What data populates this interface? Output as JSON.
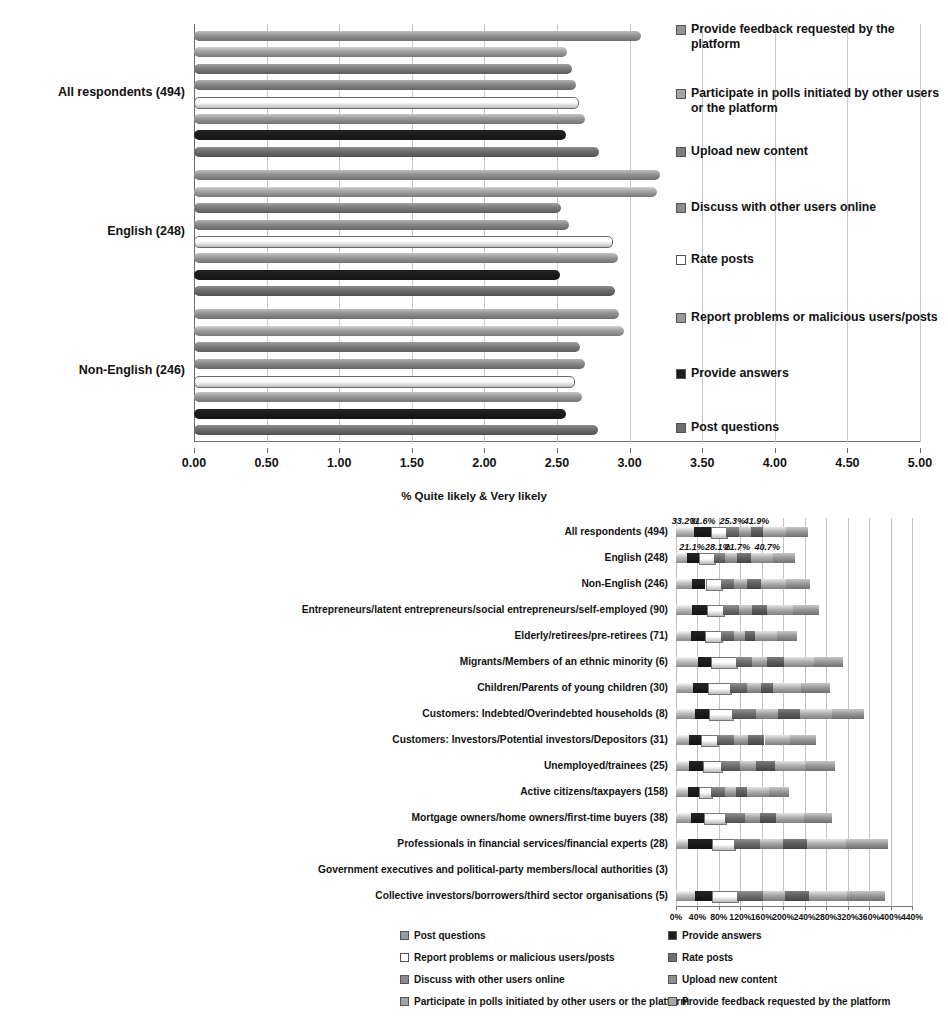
{
  "colors": {
    "post_questions": "#6e6e6e",
    "provide_answers": "#1c1c1c",
    "report_problems": "#ffffff",
    "rate_posts": "#9a9a9a",
    "discuss_online": "#8a8a8a",
    "upload_content": "#7d7d7d",
    "participate_polls": "#a3a3a3",
    "provide_feedback": "#949494",
    "gridline": "#c9c9c9",
    "axis": "#6a6a6a"
  },
  "series_labels": {
    "post_questions": "Post questions",
    "provide_answers": "Provide answers",
    "report_problems": "Report problems or malicious users/posts",
    "rate_posts": "Rate posts",
    "discuss_online": "Discuss with other users online",
    "upload_content": "Upload new content",
    "participate_polls": "Participate in polls initiated by other users or the platform",
    "provide_feedback": "Provide feedback requested by the platform"
  },
  "top_chart": {
    "legend": [
      {
        "label": "Provide feedback requested by the platform",
        "key": "provide_feedback",
        "color": "#949494"
      },
      {
        "label": "Participate in polls initiated by other users or the platform",
        "key": "participate_polls",
        "color": "#a3a3a3"
      },
      {
        "label": "Upload new content",
        "key": "upload_content",
        "color": "#7d7d7d"
      },
      {
        "label": "Discuss with other users online",
        "key": "discuss_online",
        "color": "#8a8a8a"
      },
      {
        "label": "Rate posts",
        "key": "rate_posts",
        "color": "#ffffff"
      },
      {
        "label": "Report problems or malicious users/posts",
        "key": "report_problems",
        "color": "#9a9a9a"
      },
      {
        "label": "Provide answers",
        "key": "provide_answers",
        "color": "#1c1c1c"
      },
      {
        "label": "Post questions",
        "key": "post_questions",
        "color": "#6e6e6e"
      }
    ]
  },
  "bottom_chart": {
    "title": "% Quite likely & Very likely",
    "legend_left": [
      {
        "label": "Post questions",
        "color": "#9a9a9a"
      },
      {
        "label": "Report problems or malicious users/posts",
        "color": "#ffffff"
      },
      {
        "label": "Discuss with other users online",
        "color": "#8a8a8a"
      },
      {
        "label": "Participate in polls initiated by other users or the platform",
        "color": "#a3a3a3"
      }
    ],
    "legend_right": [
      {
        "label": "Provide answers",
        "color": "#1c1c1c"
      },
      {
        "label": "Rate posts",
        "color": "#6e6e6e"
      },
      {
        "label": "Upload new content",
        "color": "#8f8f8f"
      },
      {
        "label": "Provide feedback requested by the platform",
        "color": "#a8a8a8"
      }
    ]
  },
  "chart_data": [
    {
      "type": "bar",
      "orientation": "horizontal",
      "title": "",
      "xlabel": "",
      "ylabel": "",
      "xlim": [
        0,
        5
      ],
      "xticks": [
        "0.00",
        "0.50",
        "1.00",
        "1.50",
        "2.00",
        "2.50",
        "3.00",
        "3.50",
        "4.00",
        "4.50",
        "5.00"
      ],
      "grid": true,
      "legend_position": "right",
      "categories": [
        "All respondents (494)",
        "English (248)",
        "Non-English (246)"
      ],
      "series": [
        {
          "name": "Provide feedback requested by the platform",
          "color": "#949494",
          "values": [
            3.08,
            3.21,
            2.93
          ]
        },
        {
          "name": "Participate in polls initiated by other users or the platform",
          "color": "#a3a3a3",
          "values": [
            2.57,
            3.19,
            2.96
          ]
        },
        {
          "name": "Upload new content",
          "color": "#7d7d7d",
          "values": [
            2.6,
            2.53,
            2.66
          ]
        },
        {
          "name": "Discuss with other users online",
          "color": "#8a8a8a",
          "values": [
            2.63,
            2.58,
            2.69
          ]
        },
        {
          "name": "Rate posts",
          "color": "#ffffff",
          "values": [
            2.64,
            2.87,
            2.61
          ]
        },
        {
          "name": "Report problems or malicious users/posts",
          "color": "#9a9a9a",
          "values": [
            2.69,
            2.92,
            2.67
          ]
        },
        {
          "name": "Provide answers",
          "color": "#1c1c1c",
          "values": [
            2.56,
            2.52,
            2.56
          ]
        },
        {
          "name": "Post questions",
          "color": "#6e6e6e",
          "values": [
            2.79,
            2.9,
            2.78
          ]
        }
      ]
    },
    {
      "type": "bar",
      "subtype": "stacked",
      "orientation": "horizontal",
      "title": "% Quite likely & Very likely",
      "xlabel": "",
      "ylabel": "",
      "xlim": [
        0,
        440
      ],
      "xunit": "%",
      "xticks": [
        "0%",
        "40%",
        "80%",
        "120%",
        "160%",
        "200%",
        "240%",
        "280%",
        "320%",
        "360%",
        "400%",
        "440%"
      ],
      "grid": true,
      "legend_position": "bottom",
      "categories": [
        "All respondents (494)",
        "English (248)",
        "Non-English (246)",
        "Entrepreneurs/latent entrepreneurs/social entrepreneurs/self-employed (90)",
        "Elderly/retirees/pre-retirees (71)",
        "Migrants/Members of an ethnic minority (6)",
        "Children/Parents of young children (30)",
        "Customers: Indebted/Overindebted households (8)",
        "Customers: Investors/Potential investors/Depositors (31)",
        "Unemployed/trainees (25)",
        "Active citizens/taxpayers (158)",
        "Mortgage owners/home owners/first-time buyers (38)",
        "Professionals in financial services/financial experts (28)",
        "Government executives and political-party members/local authorities (3)",
        "Collective investors/borrowers/third sector organisations (5)"
      ],
      "series": [
        {
          "name": "Post questions",
          "color": "#bdbdbd",
          "values": [
            33.2,
            21.1,
            29.0,
            30.0,
            28.0,
            41.0,
            32.0,
            36.0,
            24.0,
            25.0,
            23.0,
            28.0,
            22.0,
            0.0,
            35.0
          ]
        },
        {
          "name": "Provide answers",
          "color": "#1c1c1c",
          "values": [
            31.6,
            21.1,
            26.0,
            28.0,
            26.0,
            25.0,
            27.0,
            25.0,
            22.0,
            26.0,
            20.0,
            24.0,
            45.0,
            0.0,
            33.0
          ]
        },
        {
          "name": "Report problems or malicious users/posts",
          "color": "#ffffff",
          "values": [
            28.0,
            28.1,
            28.0,
            30.0,
            30.0,
            45.0,
            42.0,
            44.0,
            30.0,
            32.0,
            22.0,
            40.0,
            42.0,
            0.0,
            46.0
          ]
        },
        {
          "name": "Rate posts",
          "color": "#6f6f6f",
          "values": [
            25.3,
            21.7,
            26.0,
            30.0,
            24.0,
            30.0,
            32.0,
            44.0,
            33.0,
            36.0,
            26.0,
            36.0,
            48.0,
            0.0,
            48.0
          ]
        },
        {
          "name": "Discuss with other users online",
          "color": "#a5a5a5",
          "values": [
            22.0,
            22.0,
            24.0,
            24.0,
            20.0,
            28.0,
            26.0,
            42.0,
            26.0,
            30.0,
            20.0,
            28.0,
            42.0,
            0.0,
            42.0
          ]
        },
        {
          "name": "Upload new content",
          "color": "#5f5f5f",
          "values": [
            23.0,
            26.0,
            26.0,
            28.0,
            20.0,
            32.0,
            22.0,
            40.0,
            30.0,
            36.0,
            22.0,
            30.0,
            46.0,
            0.0,
            44.0
          ]
        },
        {
          "name": "Participate in polls initiated by other users or the platform",
          "color": "#b0b0b0",
          "values": [
            41.9,
            40.7,
            46.0,
            48.0,
            40.0,
            56.0,
            52.0,
            60.0,
            48.0,
            56.0,
            40.0,
            52.0,
            72.0,
            0.0,
            70.0
          ]
        },
        {
          "name": "Provide feedback requested by the platform",
          "color": "#9a9a9a",
          "values": [
            42.0,
            42.0,
            44.0,
            48.0,
            38.0,
            55.0,
            54.0,
            60.0,
            48.0,
            56.0,
            38.0,
            52.0,
            78.0,
            0.0,
            72.0
          ]
        }
      ],
      "data_labels": [
        {
          "row": 0,
          "text": "33.2%",
          "at": 16
        },
        {
          "row": 0,
          "text": "31.6%",
          "at": 50
        },
        {
          "row": 0,
          "text": "25.3%",
          "at": 105
        },
        {
          "row": 0,
          "text": "41.9%",
          "at": 150
        },
        {
          "row": 1,
          "text": "21.1%",
          "at": 30
        },
        {
          "row": 1,
          "text": "28.1%",
          "at": 78
        },
        {
          "row": 1,
          "text": "21.7%",
          "at": 114
        },
        {
          "row": 1,
          "text": "40.7%",
          "at": 170
        }
      ]
    }
  ]
}
